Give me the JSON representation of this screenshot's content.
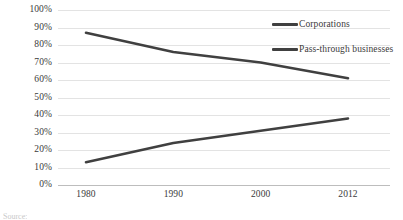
{
  "chart_data": {
    "type": "line",
    "title": "",
    "xlabel": "",
    "ylabel": "",
    "categories": [
      "1980",
      "1990",
      "2000",
      "2012"
    ],
    "ylim": [
      0,
      100
    ],
    "y_ticks": [
      "0%",
      "10%",
      "20%",
      "30%",
      "40%",
      "50%",
      "60%",
      "70%",
      "80%",
      "90%",
      "100%"
    ],
    "y_tick_values": [
      0,
      10,
      20,
      30,
      40,
      50,
      60,
      70,
      80,
      90,
      100
    ],
    "grid": true,
    "legend_position": "top-right",
    "series": [
      {
        "name": "Corporations",
        "values": [
          87,
          76,
          70,
          61
        ],
        "color": "#404040"
      },
      {
        "name": "Pass-through businesses",
        "values": [
          13,
          24,
          31,
          38
        ],
        "color": "#404040"
      }
    ]
  },
  "legend": {
    "items": [
      {
        "label": "Corporations",
        "color": "#404040",
        "swatch": "line-swatch"
      },
      {
        "label": "Pass-through businesses",
        "color": "#404040",
        "swatch": "line-swatch"
      }
    ]
  },
  "caption": {
    "text": "Source:"
  },
  "colors": {
    "gridline": "#e3e3e3",
    "axis": "#bdbdbd",
    "series": "#404040",
    "text": "#3a3a3a",
    "background": "#ffffff"
  }
}
